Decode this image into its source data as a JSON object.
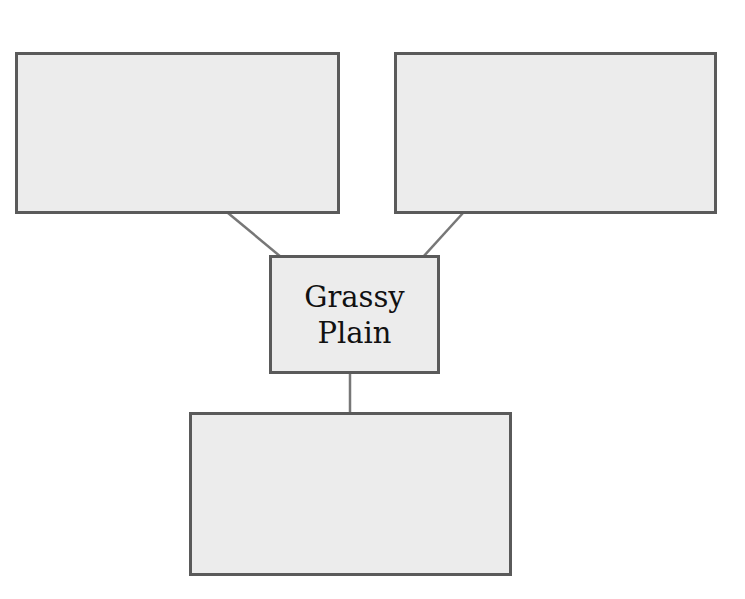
{
  "diagram": {
    "type": "concept-map",
    "colors": {
      "node_fill": "#ececec",
      "node_border": "#5a5a5a",
      "connector": "#777777",
      "text": "#111111"
    },
    "center_node": {
      "id": "center",
      "label": "Grassy\nPlain"
    },
    "nodes": [
      {
        "id": "top-left",
        "label": ""
      },
      {
        "id": "top-right",
        "label": ""
      },
      {
        "id": "bottom",
        "label": ""
      }
    ],
    "edges": [
      {
        "from": "top-left",
        "to": "center"
      },
      {
        "from": "top-right",
        "to": "center"
      },
      {
        "from": "center",
        "to": "bottom"
      }
    ]
  }
}
